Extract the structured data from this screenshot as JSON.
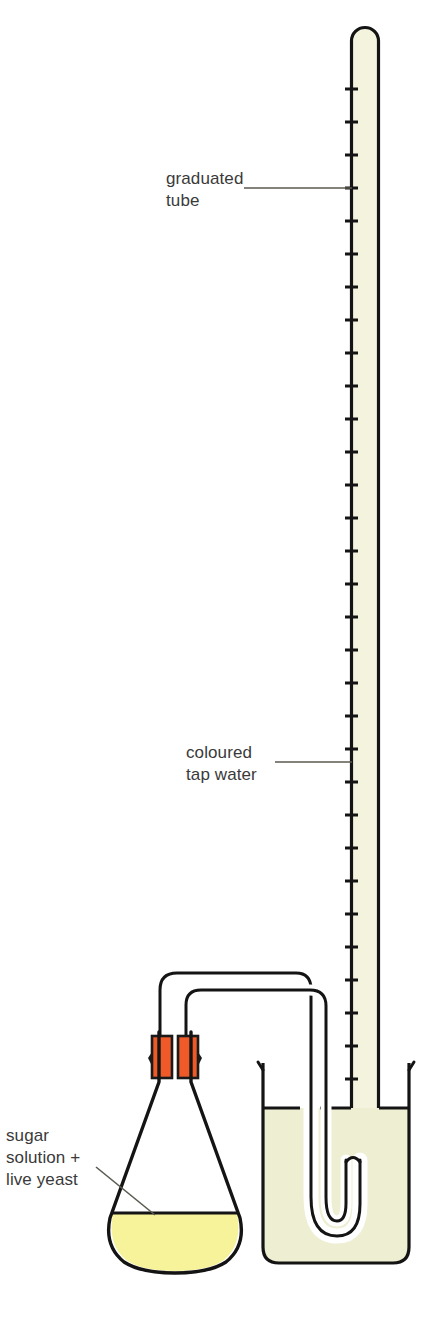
{
  "figure": {
    "kind": "science-apparatus-diagram",
    "title_visible": false,
    "background_color": "#ffffff",
    "width": 431,
    "height": 1320
  },
  "labels": {
    "graduated_tube": {
      "lines": [
        "graduated",
        "tube"
      ],
      "line1": "graduated",
      "line2": "tube",
      "anchor": "right",
      "leader": "horizontal"
    },
    "coloured_tap_water": {
      "lines": [
        "coloured",
        "tap water"
      ],
      "line1": "coloured",
      "line2": "tap water",
      "anchor": "right",
      "leader": "horizontal"
    },
    "sugar_solution_yeast": {
      "lines": [
        "sugar",
        "solution +",
        "live yeast"
      ],
      "line1": "sugar",
      "line2": "solution +",
      "line3": "live yeast",
      "anchor": "left",
      "leader": "diagonal"
    }
  },
  "apparatus": {
    "graduated_tube": {
      "name": "graduated tube",
      "sealed_top": true,
      "graduation_count": 37,
      "fill_color": "#f4f4de",
      "outline_color": "#141414"
    },
    "beaker": {
      "name": "beaker",
      "fill_color": "#eeeed2",
      "outline_color": "#141414",
      "water_level_visible": true
    },
    "conical_flask": {
      "name": "conical flask",
      "contents_color": "#f7f39a",
      "outline_color": "#141414"
    },
    "bungs": {
      "name": "rubber bungs",
      "count": 2,
      "color": "#f05a28",
      "outline_color": "#1a1a1a"
    },
    "delivery_tube": {
      "name": "delivery tube",
      "outline_color": "#141414",
      "fill_color": "#ffffff"
    }
  },
  "colors": {
    "outline": "#141414",
    "label_text": "#3a3a3a",
    "leader_line": "#5a5a50",
    "tube_water": "#f4f4de",
    "beaker_water": "#eeeed2",
    "flask_liquid": "#f7f39a",
    "bung_orange": "#f05a28",
    "background": "#ffffff"
  }
}
